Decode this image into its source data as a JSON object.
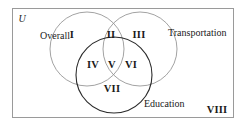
{
  "diagram": {
    "type": "venn-three-set",
    "universe_symbol": "U",
    "outer_label_bottom_right": "VIII",
    "sets": [
      {
        "id": "overall",
        "label": "Overall",
        "cx": 87,
        "cy": 49,
        "r": 37,
        "stroke": "#8a8a8a",
        "stroke_width": 0.8
      },
      {
        "id": "transportation",
        "label": "Transportation",
        "cx": 140,
        "cy": 49,
        "r": 37,
        "stroke": "#8a8a8a",
        "stroke_width": 0.8
      },
      {
        "id": "education",
        "label": "Education",
        "cx": 114,
        "cy": 75,
        "r": 38,
        "stroke": "#2b2b2b",
        "stroke_width": 1.1
      }
    ],
    "regions": [
      {
        "id": "region-1",
        "numeral": "I",
        "x": 72,
        "y": 35,
        "meaning": "Overall only"
      },
      {
        "id": "region-2",
        "numeral": "II",
        "x": 111,
        "y": 35,
        "meaning": "Overall and Transportation only"
      },
      {
        "id": "region-3",
        "numeral": "III",
        "x": 139,
        "y": 35,
        "meaning": "Transportation only"
      },
      {
        "id": "region-4",
        "numeral": "IV",
        "x": 93,
        "y": 65,
        "meaning": "Overall and Education only"
      },
      {
        "id": "region-5",
        "numeral": "V",
        "x": 112,
        "y": 65,
        "meaning": "Overall, Transportation and Education"
      },
      {
        "id": "region-6",
        "numeral": "VI",
        "x": 131,
        "y": 65,
        "meaning": "Transportation and Education only"
      },
      {
        "id": "region-7",
        "numeral": "VII",
        "x": 112,
        "y": 89,
        "meaning": "Education only"
      },
      {
        "id": "region-8",
        "numeral": "VIII",
        "x": 217,
        "y": 110,
        "meaning": "Outside all three sets"
      }
    ],
    "set_label_positions": [
      {
        "id": "label-overall",
        "x": 40,
        "y": 36,
        "anchor": "left"
      },
      {
        "id": "label-transportation",
        "x": 168,
        "y": 33,
        "anchor": "left"
      },
      {
        "id": "label-education",
        "x": 144,
        "y": 104,
        "anchor": "left"
      }
    ],
    "universe_position": {
      "x": 22,
      "y": 19
    },
    "frame": {
      "x": 12,
      "y": 8,
      "width": 222,
      "height": 110,
      "stroke": "#9a9a9a",
      "stroke_width": 1
    },
    "colors": {
      "background": "#ffffff",
      "frame_border": "#9a9a9a",
      "light_circle": "#8a8a8a",
      "dark_circle": "#2b2b2b",
      "text": "#1a1a1a"
    }
  }
}
